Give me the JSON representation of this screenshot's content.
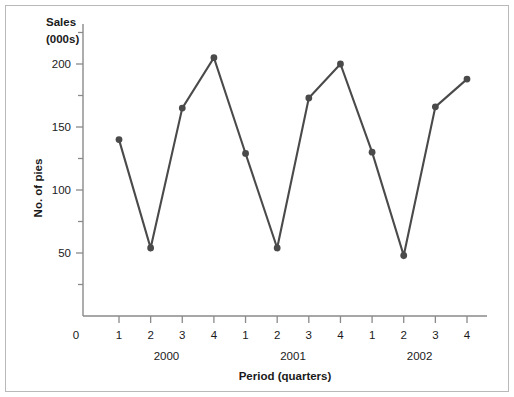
{
  "chart_data": {
    "type": "line",
    "title": "",
    "unit_label_line1": "Sales",
    "unit_label_line2": "(000s)",
    "ylabel": "No. of pies",
    "xlabel": "Period (quarters)",
    "categories": [
      "1",
      "2",
      "3",
      "4",
      "1",
      "2",
      "3",
      "4",
      "1",
      "2",
      "3",
      "4"
    ],
    "group_labels": [
      "2000",
      "2001",
      "2002"
    ],
    "values": [
      140,
      54,
      165,
      205,
      129,
      54,
      173,
      200,
      130,
      48,
      166,
      188
    ],
    "series": [
      {
        "name": "No. of pies",
        "values": [
          140,
          54,
          165,
          205,
          129,
          54,
          173,
          200,
          130,
          48,
          166,
          188
        ]
      }
    ],
    "ytick_labels": [
      "0",
      "50",
      "100",
      "150",
      "200"
    ],
    "ytick_values": [
      0,
      50,
      100,
      150,
      200
    ],
    "yminor_values": [
      25,
      75,
      125,
      175,
      225
    ],
    "ylim": [
      0,
      230
    ],
    "xlim": [
      0,
      13
    ],
    "grid": false,
    "legend": "none",
    "marker": "circle",
    "line_color": "#4a4a4a",
    "axis_color": "#8a8a8a",
    "frame_color": "#b9b9b9",
    "background": "#ffffff",
    "origin_label": "0"
  }
}
